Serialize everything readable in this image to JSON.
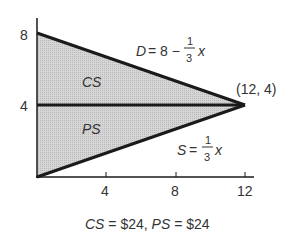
{
  "diagram": {
    "axis": {
      "y_ticks": [
        "8",
        "4"
      ],
      "x_ticks": [
        "4",
        "8",
        "12"
      ]
    },
    "regions": {
      "consumer_surplus": "CS",
      "producer_surplus": "PS"
    },
    "curves": {
      "demand": {
        "lhs": "D",
        "eq": "= 8 −",
        "num": "1",
        "den": "3",
        "var": "x"
      },
      "supply": {
        "lhs": "S",
        "eq": "=",
        "num": "1",
        "den": "3",
        "var": "x"
      }
    },
    "equilibrium_label": "(12, 4)",
    "caption": {
      "cs_label": "CS",
      "cs_value": "= $24,",
      "ps_label": "PS",
      "ps_value": "= $24"
    },
    "colors": {
      "shade": "#cfcfcf",
      "line": "#1a1a1a"
    }
  }
}
